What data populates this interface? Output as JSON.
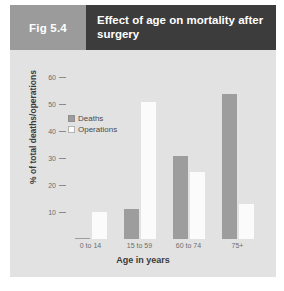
{
  "figure": {
    "tag": "Fig 5.4",
    "title": "Effect of age on mortality after surgery"
  },
  "colors": {
    "tag_background": "#9b9b9b",
    "title_background": "#3c3c3c",
    "panel_background": "#e2e2e2",
    "deaths": "#9d9d9d",
    "operations": "#fbfbfb"
  },
  "chart_data": {
    "type": "bar",
    "title": "Effect of age on mortality after surgery",
    "xlabel": "Age in years",
    "ylabel": "% of total deaths/operations",
    "categories": [
      "0 to 14",
      "15 to 59",
      "60 to 74",
      "75+"
    ],
    "series": [
      {
        "name": "Deaths",
        "values": [
          0.5,
          11,
          31,
          54
        ]
      },
      {
        "name": "Operations",
        "values": [
          10,
          51,
          25,
          13
        ]
      }
    ],
    "ylim": [
      0,
      62
    ],
    "yticks": [
      10,
      20,
      30,
      40,
      50,
      60
    ],
    "ytick_labels": [
      "10",
      "20",
      "30",
      "40",
      "50",
      "60"
    ],
    "grid": false,
    "legend_position": "upper left"
  }
}
